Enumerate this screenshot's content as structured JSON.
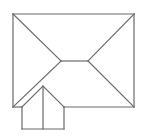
{
  "diagram": {
    "type": "roof-plan",
    "line_color": "#6a6a6a",
    "background_color": "#ffffff",
    "elements": [
      {
        "name": "main-hip-roof",
        "kind": "hip roof",
        "parts": [
          "outline",
          "ridge",
          "four hips"
        ]
      },
      {
        "name": "front-gable",
        "kind": "gable roof",
        "parts": [
          "outline",
          "center ridge"
        ]
      }
    ]
  }
}
